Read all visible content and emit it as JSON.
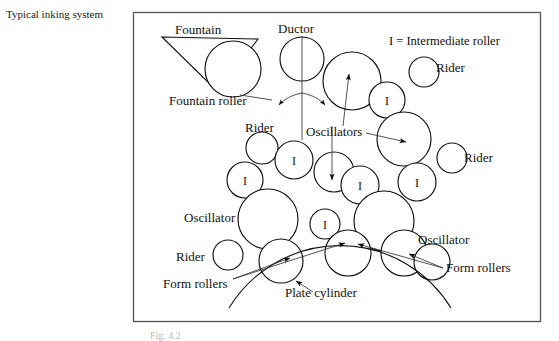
{
  "page": {
    "title": "Typical inking system",
    "caption": "Fig. 4.2",
    "background": "#ffffff",
    "ink_color": "#111111",
    "frame_color": "#555555"
  },
  "legend": {
    "text": "I = Intermediate roller"
  },
  "labels": {
    "fountain": "Fountain",
    "fountain_roller": "Fountain roller",
    "ductor": "Ductor",
    "rider_left": "Rider",
    "rider_right_top": "Rider",
    "rider_right_mid": "Rider",
    "rider_bottom": "Rider",
    "oscillators": "Oscillators",
    "oscillator_left": "Oscillator",
    "oscillator_right": "Oscillator",
    "form_rollers_left": "Form rollers",
    "form_rollers_right": "Form rollers",
    "plate_cylinder": "Plate cylinder"
  },
  "roller_marks": {
    "intermediate": "I"
  },
  "diagram": {
    "type": "schematic",
    "frame": {
      "x": 133,
      "y": 12,
      "width": 408,
      "height": 310
    },
    "rollers": [
      {
        "name": "fountain-roller",
        "cx": 233,
        "cy": 69,
        "r": 28,
        "mark": ""
      },
      {
        "name": "ductor-roller",
        "cx": 302,
        "cy": 59,
        "r": 22,
        "mark": ""
      },
      {
        "name": "oscillator-upper",
        "cx": 352,
        "cy": 81,
        "r": 29,
        "mark": ""
      },
      {
        "name": "intermediate-upper-right",
        "cx": 387,
        "cy": 100,
        "r": 18,
        "mark": "I"
      },
      {
        "name": "rider-upper-right",
        "cx": 424,
        "cy": 72,
        "r": 15,
        "mark": ""
      },
      {
        "name": "oscillator-right-upper",
        "cx": 404,
        "cy": 139,
        "r": 27,
        "mark": ""
      },
      {
        "name": "rider-mid-right",
        "cx": 452,
        "cy": 158,
        "r": 15,
        "mark": ""
      },
      {
        "name": "rider-mid-left",
        "cx": 262,
        "cy": 148,
        "r": 16,
        "mark": ""
      },
      {
        "name": "intermediate-mid-1",
        "cx": 294,
        "cy": 160,
        "r": 19,
        "mark": "I"
      },
      {
        "name": "intermediate-mid-left",
        "cx": 245,
        "cy": 180,
        "r": 18,
        "mark": "I"
      },
      {
        "name": "intermediate-mid-2",
        "cx": 334,
        "cy": 172,
        "r": 20,
        "mark": ""
      },
      {
        "name": "intermediate-mid-3",
        "cx": 360,
        "cy": 185,
        "r": 19,
        "mark": "I"
      },
      {
        "name": "intermediate-mid-4",
        "cx": 417,
        "cy": 182,
        "r": 19,
        "mark": "I"
      },
      {
        "name": "oscillator-left-large",
        "cx": 268,
        "cy": 219,
        "r": 30,
        "mark": ""
      },
      {
        "name": "intermediate-lower",
        "cx": 325,
        "cy": 224,
        "r": 15,
        "mark": "I"
      },
      {
        "name": "oscillator-right-large",
        "cx": 384,
        "cy": 221,
        "r": 30,
        "mark": ""
      },
      {
        "name": "rider-lower-left",
        "cx": 228,
        "cy": 255,
        "r": 15,
        "mark": ""
      },
      {
        "name": "form-roller-left",
        "cx": 281,
        "cy": 261,
        "r": 22,
        "mark": ""
      },
      {
        "name": "form-roller-mid",
        "cx": 348,
        "cy": 253,
        "r": 23,
        "mark": ""
      },
      {
        "name": "form-roller-right-1",
        "cx": 404,
        "cy": 253,
        "r": 23,
        "mark": ""
      },
      {
        "name": "form-roller-right-2",
        "cx": 432,
        "cy": 262,
        "r": 18,
        "mark": ""
      }
    ],
    "plate_cylinder": {
      "name": "plate-cylinder-arc",
      "cx": 340,
      "cy": 420,
      "r": 130
    }
  }
}
